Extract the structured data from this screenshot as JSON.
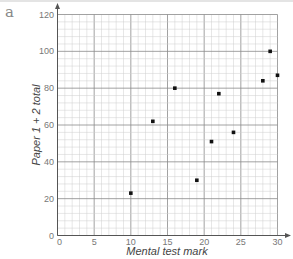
{
  "panel_label": "a",
  "chart_data": {
    "type": "scatter",
    "title": "",
    "xlabel": "Mental test mark",
    "ylabel": "Paper 1 + 2 total",
    "xlim": [
      0,
      30
    ],
    "ylim": [
      0,
      120
    ],
    "xticks": [
      0,
      5,
      10,
      15,
      20,
      25,
      30
    ],
    "yticks": [
      0,
      20,
      40,
      60,
      80,
      100,
      120
    ],
    "grid": true,
    "legend": null,
    "points": [
      {
        "x": 10,
        "y": 23
      },
      {
        "x": 13,
        "y": 62
      },
      {
        "x": 16,
        "y": 80
      },
      {
        "x": 19,
        "y": 30
      },
      {
        "x": 21,
        "y": 51
      },
      {
        "x": 22,
        "y": 77
      },
      {
        "x": 24,
        "y": 56
      },
      {
        "x": 28,
        "y": 84
      },
      {
        "x": 29,
        "y": 100
      },
      {
        "x": 30,
        "y": 87
      }
    ]
  },
  "colors": {
    "minor_grid": "#cfcfcf",
    "major_grid": "#8a8a8a",
    "axis": "#555555",
    "point": "#111111"
  }
}
